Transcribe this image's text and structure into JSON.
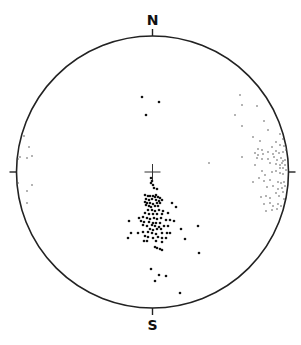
{
  "diagram": {
    "type": "stereonet",
    "labels": {
      "north": "N",
      "south": "S"
    },
    "net": {
      "cx": 152.5,
      "cy": 172,
      "r": 136,
      "stroke": "#222222"
    },
    "center_cross": {
      "x": 152.5,
      "y": 172,
      "size": 8
    },
    "colors": {
      "dark_point": "#111111",
      "light_point": "#555555"
    },
    "dark_points": [
      [
        142,
        97
      ],
      [
        159,
        102
      ],
      [
        146,
        115
      ],
      [
        151,
        178
      ],
      [
        152,
        181
      ],
      [
        151,
        183
      ],
      [
        153,
        185
      ],
      [
        154,
        188
      ],
      [
        157,
        189
      ],
      [
        156,
        195
      ],
      [
        153,
        196
      ],
      [
        145,
        195
      ],
      [
        148,
        196
      ],
      [
        150,
        196
      ],
      [
        155,
        197
      ],
      [
        158,
        197
      ],
      [
        160,
        198
      ],
      [
        146,
        199
      ],
      [
        149,
        200
      ],
      [
        152,
        199
      ],
      [
        156,
        200
      ],
      [
        159,
        201
      ],
      [
        162,
        200
      ],
      [
        145,
        202
      ],
      [
        147,
        203
      ],
      [
        150,
        203
      ],
      [
        153,
        204
      ],
      [
        157,
        203
      ],
      [
        160,
        203
      ],
      [
        146,
        205
      ],
      [
        149,
        206
      ],
      [
        151,
        207
      ],
      [
        155,
        206
      ],
      [
        158,
        206
      ],
      [
        172,
        203
      ],
      [
        176,
        207
      ],
      [
        148,
        210
      ],
      [
        152,
        210
      ],
      [
        155,
        211
      ],
      [
        159,
        210
      ],
      [
        163,
        211
      ],
      [
        145,
        213
      ],
      [
        149,
        214
      ],
      [
        153,
        214
      ],
      [
        157,
        214
      ],
      [
        162,
        214
      ],
      [
        168,
        213
      ],
      [
        139,
        218
      ],
      [
        143,
        217
      ],
      [
        147,
        218
      ],
      [
        150,
        219
      ],
      [
        154,
        218
      ],
      [
        157,
        219
      ],
      [
        161,
        218
      ],
      [
        166,
        220
      ],
      [
        170,
        220
      ],
      [
        129,
        221
      ],
      [
        141,
        221
      ],
      [
        144,
        222
      ],
      [
        149,
        222
      ],
      [
        153,
        223
      ],
      [
        156,
        223
      ],
      [
        160,
        223
      ],
      [
        174,
        221
      ],
      [
        143,
        225
      ],
      [
        147,
        226
      ],
      [
        152,
        225
      ],
      [
        155,
        226
      ],
      [
        159,
        227
      ],
      [
        164,
        226
      ],
      [
        168,
        226
      ],
      [
        181,
        229
      ],
      [
        198,
        226
      ],
      [
        150,
        229
      ],
      [
        153,
        230
      ],
      [
        157,
        229
      ],
      [
        161,
        229
      ],
      [
        131,
        233
      ],
      [
        138,
        233
      ],
      [
        143,
        232
      ],
      [
        148,
        232
      ],
      [
        152,
        233
      ],
      [
        156,
        234
      ],
      [
        162,
        233
      ],
      [
        167,
        233
      ],
      [
        170,
        233
      ],
      [
        128,
        238
      ],
      [
        145,
        236
      ],
      [
        148,
        237
      ],
      [
        153,
        238
      ],
      [
        158,
        237
      ],
      [
        162,
        238
      ],
      [
        166,
        238
      ],
      [
        185,
        239
      ],
      [
        144,
        241
      ],
      [
        147,
        241
      ],
      [
        156,
        241
      ],
      [
        162,
        242
      ],
      [
        155,
        247
      ],
      [
        157,
        248
      ],
      [
        160,
        249
      ],
      [
        162,
        250
      ],
      [
        199,
        253
      ],
      [
        151,
        269
      ],
      [
        159,
        275
      ],
      [
        166,
        276
      ],
      [
        155,
        281
      ],
      [
        180,
        293
      ]
    ],
    "light_points": [
      [
        240,
        95
      ],
      [
        242,
        105
      ],
      [
        257,
        106
      ],
      [
        235,
        115
      ],
      [
        242,
        126
      ],
      [
        264,
        121
      ],
      [
        268,
        130
      ],
      [
        253,
        137
      ],
      [
        260,
        141
      ],
      [
        280,
        134
      ],
      [
        283,
        139
      ],
      [
        258,
        149
      ],
      [
        262,
        150
      ],
      [
        272,
        147
      ],
      [
        276,
        142
      ],
      [
        280,
        145
      ],
      [
        284,
        146
      ],
      [
        255,
        153
      ],
      [
        258,
        155
      ],
      [
        263,
        154
      ],
      [
        268,
        152
      ],
      [
        273,
        154
      ],
      [
        276,
        151
      ],
      [
        279,
        153
      ],
      [
        283,
        152
      ],
      [
        286,
        150
      ],
      [
        242,
        157
      ],
      [
        257,
        158
      ],
      [
        262,
        159
      ],
      [
        268,
        159
      ],
      [
        274,
        157
      ],
      [
        277,
        160
      ],
      [
        281,
        158
      ],
      [
        283,
        161
      ],
      [
        285,
        160
      ],
      [
        209,
        163
      ],
      [
        255,
        165
      ],
      [
        270,
        163
      ],
      [
        276,
        164
      ],
      [
        280,
        165
      ],
      [
        282,
        163
      ],
      [
        285,
        165
      ],
      [
        283,
        168
      ],
      [
        280,
        168
      ],
      [
        262,
        171
      ],
      [
        265,
        175
      ],
      [
        272,
        172
      ],
      [
        276,
        171
      ],
      [
        280,
        173
      ],
      [
        283,
        174
      ],
      [
        286,
        170
      ],
      [
        253,
        182
      ],
      [
        259,
        178
      ],
      [
        264,
        181
      ],
      [
        270,
        180
      ],
      [
        278,
        182
      ],
      [
        281,
        183
      ],
      [
        284,
        182
      ],
      [
        267,
        187
      ],
      [
        273,
        186
      ],
      [
        278,
        189
      ],
      [
        282,
        188
      ],
      [
        285,
        186
      ],
      [
        261,
        197
      ],
      [
        266,
        196
      ],
      [
        270,
        198
      ],
      [
        276,
        193
      ],
      [
        279,
        196
      ],
      [
        283,
        192
      ],
      [
        284,
        199
      ],
      [
        264,
        204
      ],
      [
        270,
        203
      ],
      [
        273,
        206
      ],
      [
        278,
        204
      ],
      [
        281,
        206
      ],
      [
        277,
        209
      ],
      [
        266,
        211
      ],
      [
        272,
        210
      ],
      [
        24,
        136
      ],
      [
        29,
        147
      ],
      [
        32,
        156
      ],
      [
        27,
        158
      ],
      [
        20,
        157
      ],
      [
        18,
        159
      ],
      [
        18,
        183
      ],
      [
        27,
        191
      ],
      [
        32,
        185
      ],
      [
        27,
        203
      ]
    ]
  }
}
